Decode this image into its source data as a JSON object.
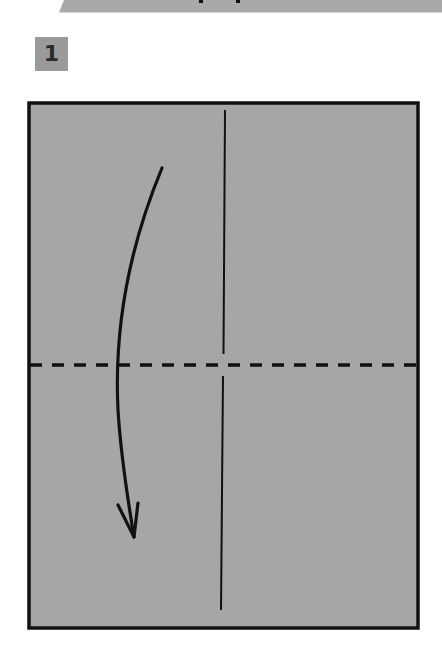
{
  "step": {
    "number": "1",
    "badge_color": "#9a9a9a"
  },
  "banner": {
    "color": "#a9a9a9",
    "text_fragment": ""
  },
  "diagram": {
    "paper_color": "#a6a6a6",
    "outline_color": "#111111",
    "paper": {
      "x": 29,
      "y": 103,
      "width": 389,
      "height": 525
    },
    "center_crease": {
      "x_top": 225,
      "y_top": 110,
      "x_bottom": 221,
      "y_bottom": 610,
      "gap_y": [
        354,
        376
      ]
    },
    "valley_fold_line": {
      "y": 365,
      "style": "dashed"
    },
    "fold_arrow": {
      "direction": "down",
      "start": [
        162,
        168
      ],
      "end": [
        134,
        537
      ]
    }
  }
}
